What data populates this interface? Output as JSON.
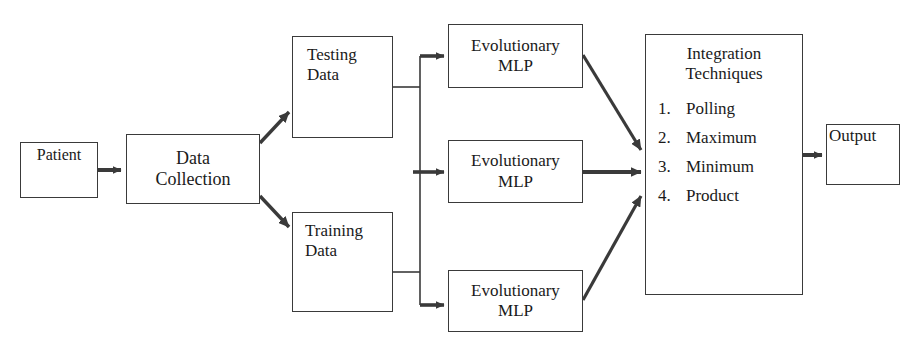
{
  "diagram": {
    "stroke_color": "#3a3a3a",
    "text_color": "#1a1a1a",
    "background_color": "#ffffff"
  },
  "nodes": {
    "patient": {
      "label": "Patient"
    },
    "data_collection": {
      "line1": "Data",
      "line2": "Collection"
    },
    "testing_data": {
      "line1": "Testing",
      "line2": "Data"
    },
    "training_data": {
      "line1": "Training",
      "line2": "Data"
    },
    "mlp_1": {
      "line1": "Evolutionary",
      "line2": "MLP"
    },
    "mlp_2": {
      "line1": "Evolutionary",
      "line2": "MLP"
    },
    "mlp_3": {
      "line1": "Evolutionary",
      "line2": "MLP"
    },
    "integration": {
      "title_line1": "Integration",
      "title_line2": "Techniques",
      "items": [
        {
          "number": "1.",
          "label": "Polling"
        },
        {
          "number": "2.",
          "label": "Maximum"
        },
        {
          "number": "3.",
          "label": "Minimum"
        },
        {
          "number": "4.",
          "label": "Product"
        }
      ]
    },
    "output": {
      "label": "Output"
    }
  }
}
